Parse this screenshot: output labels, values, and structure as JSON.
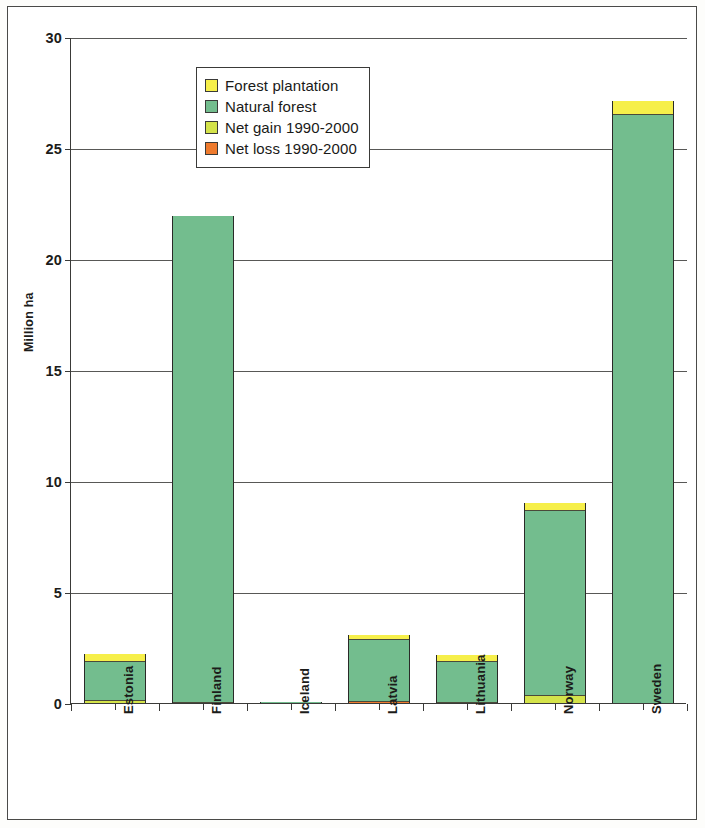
{
  "chart_data": {
    "type": "bar",
    "subtype": "stacked-bar",
    "title": "",
    "xlabel": "",
    "ylabel": "Million ha",
    "ylim": [
      0,
      30
    ],
    "ytick_values": [
      0,
      5,
      10,
      15,
      20,
      25,
      30
    ],
    "ytick_labels": [
      "0",
      "5",
      "10",
      "15",
      "20",
      "25",
      "30"
    ],
    "grid": true,
    "legend_position": "upper-left-inside",
    "categories": [
      "Estonia",
      "Finland",
      "Iceland",
      "Latvia",
      "Lithuania",
      "Norway",
      "Sweden"
    ],
    "series": [
      {
        "name": "Net gain 1990-2000",
        "color": "#d4e34a",
        "stack_order": 0,
        "values": [
          0.15,
          0.05,
          0.0,
          0.0,
          0.0,
          0.35,
          0.0
        ]
      },
      {
        "name": "Net loss 1990-2000",
        "color": "#ef7b2e",
        "stack_order": 1,
        "values": [
          0.0,
          0.0,
          0.0,
          0.1,
          0.05,
          0.0,
          0.0
        ]
      },
      {
        "name": "Natural forest",
        "color": "#73bd8e",
        "stack_order": 2,
        "values": [
          1.7,
          21.9,
          0.05,
          2.75,
          1.8,
          8.3,
          26.5
        ]
      },
      {
        "name": "Forest plantation",
        "color": "#f6ef4a",
        "stack_order": 3,
        "values": [
          0.35,
          0.0,
          0.0,
          0.2,
          0.3,
          0.35,
          0.6
        ]
      }
    ],
    "totals": [
      2.2,
      21.95,
      0.05,
      3.05,
      2.15,
      9.0,
      27.1
    ]
  },
  "axis": {
    "y_title": "Million ha",
    "y_ticks": [
      "30",
      "25",
      "20",
      "15",
      "10",
      "5",
      "0"
    ],
    "x_labels": [
      "Estonia",
      "Finland",
      "Iceland",
      "Latvia",
      "Lithuania",
      "Norway",
      "Sweden"
    ]
  },
  "legend": {
    "items": [
      {
        "label": "Forest plantation",
        "color": "#f6ef4a",
        "icon": "legend-swatch-icon"
      },
      {
        "label": "Natural forest",
        "color": "#73bd8e",
        "icon": "legend-swatch-icon"
      },
      {
        "label": "Net gain 1990-2000",
        "color": "#d4e34a",
        "icon": "legend-swatch-icon"
      },
      {
        "label": "Net loss 1990-2000",
        "color": "#ef7b2e",
        "icon": "legend-swatch-icon"
      }
    ]
  },
  "colors": {
    "plantation": "#f6ef4a",
    "natural": "#73bd8e",
    "net_gain": "#d4e34a",
    "net_loss": "#ef7b2e",
    "axis": "#3a3a38",
    "grid": "#585856",
    "background": "#ffffff"
  }
}
